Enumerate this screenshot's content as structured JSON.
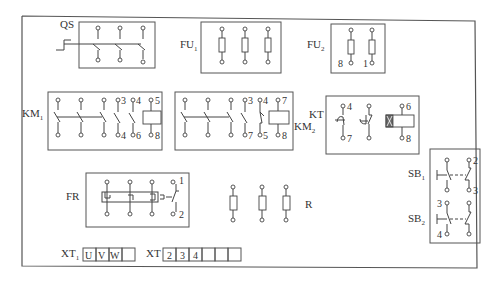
{
  "diagram": {
    "title": "",
    "background": "#ffffff",
    "line_color": "#444444",
    "components": {
      "QS": {
        "label": "QS",
        "type": "three-pole knife switch",
        "poles": 3
      },
      "FU1": {
        "label": "FU",
        "sub": "1",
        "type": "main fuses",
        "count": 3
      },
      "FU2": {
        "label": "FU",
        "sub": "2",
        "type": "control fuses",
        "count": 2,
        "terminals": [
          "8",
          "1"
        ]
      },
      "KM1": {
        "label": "KM",
        "sub": "1",
        "type": "contactor",
        "main_poles": 3,
        "aux_terminals_top": [
          "3",
          "4",
          "5"
        ],
        "aux_terminals_bottom": [
          "4",
          "6",
          "8"
        ]
      },
      "KM2": {
        "label": "KM",
        "sub": "2",
        "type": "contactor",
        "main_poles": 3,
        "aux_terminals_top": [
          "3",
          "4",
          "7"
        ],
        "aux_terminals_bottom": [
          "7",
          "5",
          "8"
        ]
      },
      "KT": {
        "label": "KT",
        "type": "time relay",
        "terminals_top": [
          "4",
          "",
          "6"
        ],
        "terminals_bottom": [
          "7",
          "",
          "8"
        ]
      },
      "FR": {
        "label": "FR",
        "type": "thermal overload relay",
        "terminals": [
          "1",
          "2"
        ]
      },
      "R": {
        "label": "R",
        "type": "resistors",
        "count": 3
      },
      "SB1": {
        "label": "SB",
        "sub": "1",
        "type": "pushbutton",
        "terminals": [
          "2",
          "3"
        ]
      },
      "SB2": {
        "label": "SB",
        "sub": "2",
        "type": "pushbutton",
        "terminals": [
          "3",
          "4"
        ]
      },
      "XT1": {
        "label": "XT",
        "sub": "1",
        "type": "terminal block",
        "cells": [
          "U",
          "V",
          "W",
          ""
        ]
      },
      "XT": {
        "label": "XT",
        "type": "terminal block",
        "cells": [
          "2",
          "3",
          "4",
          "",
          "",
          ""
        ]
      }
    }
  }
}
